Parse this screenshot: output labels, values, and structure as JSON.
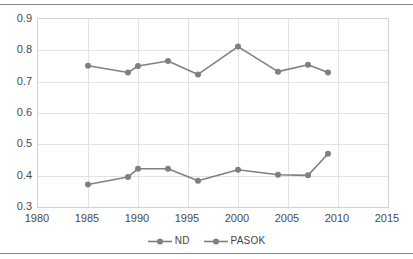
{
  "chart_data": {
    "type": "line",
    "title": "",
    "xlabel": "",
    "ylabel": "",
    "xlim": [
      1980,
      2015
    ],
    "ylim": [
      0.3,
      0.9
    ],
    "xticks": [
      1980,
      1985,
      1990,
      1995,
      2000,
      2005,
      2010,
      2015
    ],
    "yticks": [
      0.3,
      0.4,
      0.5,
      0.6,
      0.7,
      0.8,
      0.9
    ],
    "xtick_labels": [
      "1980",
      "1985",
      "1990",
      "1995",
      "2000",
      "2005",
      "2010",
      "2015"
    ],
    "ytick_labels": [
      "0.3",
      "0.4",
      "0.5",
      "0.6",
      "0.7",
      "0.8",
      "0.9"
    ],
    "grid": true,
    "legend_position": "bottom",
    "x": [
      1985,
      1989,
      1990,
      1993,
      1996,
      2000,
      2004,
      2007,
      2009
    ],
    "series": [
      {
        "name": "ND",
        "color": "#808080",
        "values": [
          0.751,
          0.729,
          0.75,
          0.766,
          0.723,
          0.812,
          0.732,
          0.754,
          0.729
        ]
      },
      {
        "name": "PASOK",
        "color": "#808080",
        "values": [
          0.372,
          0.396,
          0.422,
          0.422,
          0.384,
          0.419,
          0.403,
          0.401,
          0.47
        ]
      }
    ]
  },
  "legend": {
    "entries": [
      {
        "label": "ND"
      },
      {
        "label": "PASOK"
      }
    ]
  },
  "colors": {
    "series_line": "#808080",
    "marker": "#7f7f7f",
    "gridline": "#e2e2e2",
    "plot_border": "#d2d2d2",
    "axis_text": "#4a4a4a",
    "page_rule": "#8a8a8a"
  }
}
